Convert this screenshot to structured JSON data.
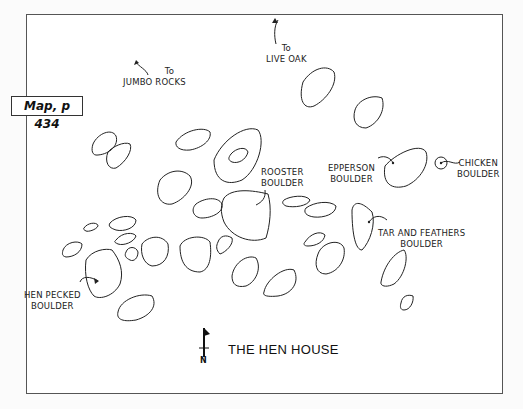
{
  "map": {
    "title": "THE HEN HOUSE",
    "reference_badge": "Map, p 434",
    "north_indicator": "N",
    "directions": [
      {
        "prefix": "To",
        "destination": "JUMBO ROCKS"
      },
      {
        "prefix": "To",
        "destination": "LIVE OAK"
      }
    ],
    "boulder_labels": [
      {
        "line1": "ROOSTER",
        "line2": "BOULDER"
      },
      {
        "line1": "EPPERSON",
        "line2": "BOULDER"
      },
      {
        "line1": "CHICKEN",
        "line2": "BOULDER"
      },
      {
        "line1": "TAR AND FEATHERS",
        "line2": "BOULDER"
      },
      {
        "line1": "HEN PECKED",
        "line2": "BOULDER"
      }
    ],
    "colors": {
      "line": "#222222",
      "frame": "#555555",
      "background": "#ffffff"
    }
  }
}
